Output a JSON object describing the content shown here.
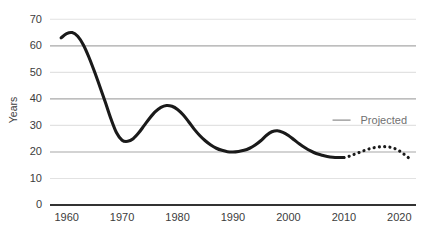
{
  "chart_data": {
    "type": "line",
    "title": "",
    "xlabel": "",
    "ylabel": "Years",
    "xlim": [
      1957,
      2023
    ],
    "ylim": [
      0,
      72
    ],
    "grid": true,
    "legend_position": "none",
    "yticks": [
      0,
      10,
      20,
      30,
      40,
      50,
      60,
      70
    ],
    "ytick_labels": [
      "0",
      "10",
      "20",
      "30",
      "40",
      "50",
      "60",
      "70"
    ],
    "xticks": [
      1960,
      1970,
      1980,
      1990,
      2000,
      2010,
      2020
    ],
    "xtick_labels": [
      "1960",
      "1970",
      "1980",
      "1990",
      "2000",
      "2010",
      "2020"
    ],
    "annotations": [
      {
        "text": "Projected",
        "x": 2013,
        "y": 32,
        "color": "#707070"
      }
    ],
    "series": [
      {
        "name": "Historical",
        "style": "solid",
        "color": "#1a1a1a",
        "width": 3.1,
        "x": [
          1959,
          1960,
          1961,
          1962,
          1963,
          1964,
          1965,
          1966,
          1967,
          1968,
          1969,
          1970,
          1971,
          1972,
          1973,
          1974,
          1975,
          1976,
          1977,
          1978,
          1979,
          1980,
          1981,
          1982,
          1983,
          1984,
          1985,
          1986,
          1987,
          1988,
          1989,
          1990,
          1991,
          1992,
          1993,
          1994,
          1995,
          1996,
          1997,
          1998,
          1999,
          2000,
          2001,
          2002,
          2003,
          2004,
          2005,
          2006,
          2007,
          2008,
          2009,
          2010
        ],
        "values": [
          63.0,
          64.6,
          65.0,
          63.6,
          60.4,
          55.8,
          50.4,
          44.6,
          38.6,
          32.4,
          27.2,
          24.4,
          24.0,
          25.0,
          27.2,
          30.0,
          32.8,
          35.2,
          36.8,
          37.5,
          37.2,
          36.0,
          34.0,
          31.4,
          28.6,
          26.2,
          24.2,
          22.6,
          21.4,
          20.6,
          20.1,
          20.0,
          20.2,
          20.6,
          21.4,
          22.6,
          24.2,
          26.2,
          27.6,
          28.0,
          27.4,
          26.2,
          24.6,
          23.0,
          21.6,
          20.4,
          19.4,
          18.8,
          18.3,
          18.0,
          17.9,
          17.9
        ]
      },
      {
        "name": "Projected",
        "style": "dotted",
        "color": "#1a1a1a",
        "width": 3.1,
        "x": [
          2010,
          2011,
          2012,
          2013,
          2014,
          2015,
          2016,
          2017,
          2018,
          2019,
          2020,
          2021,
          2022
        ],
        "values": [
          17.9,
          18.4,
          19.2,
          20.0,
          20.8,
          21.4,
          21.8,
          22.0,
          21.9,
          21.4,
          20.4,
          18.9,
          17.2
        ]
      }
    ],
    "gridline_colors": {
      "major": "#a8a8a8",
      "minor": "#e2e2e2",
      "baseline": "#333333"
    }
  }
}
